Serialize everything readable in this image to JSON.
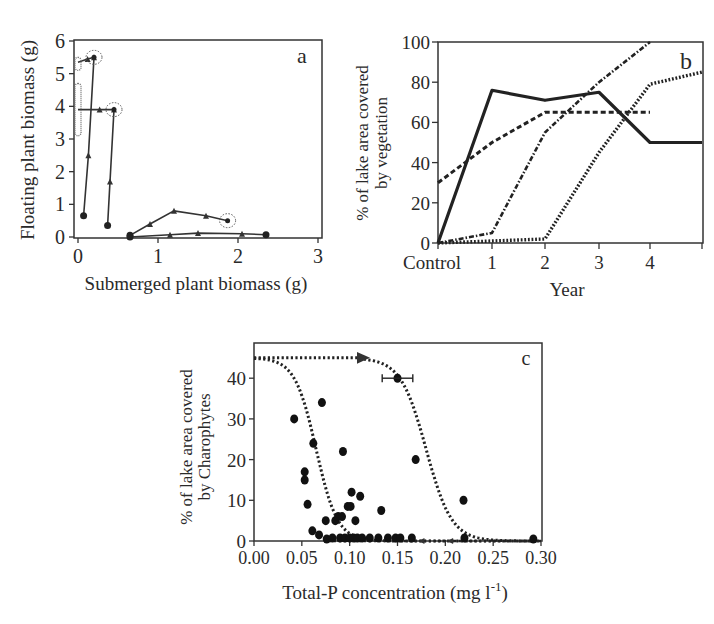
{
  "chart_data": [
    {
      "panel": "a",
      "type": "line",
      "title": "",
      "panel_label": "a",
      "xlabel": "Submerged plant biomass (g)",
      "ylabel": "Floating plant  biomass (g)",
      "xlim": [
        0,
        3
      ],
      "ylim": [
        0,
        6
      ],
      "xticks": [
        "0",
        "1",
        "2",
        "3"
      ],
      "yticks": [
        "0",
        "1",
        "2",
        "3",
        "4",
        "5",
        "6"
      ],
      "grid": false,
      "legend": null,
      "series": [
        {
          "name": "trajectory 1 (floating-dominated start)",
          "points": [
            [
              0.07,
              0.65
            ],
            [
              0.13,
              2.5
            ],
            [
              0.2,
              5.5
            ],
            [
              0.12,
              5.45
            ],
            [
              0.0,
              5.35
            ]
          ],
          "end_circled": [
            0.2,
            5.5
          ],
          "cluster_at_x0": [
            5.1,
            5.5
          ]
        },
        {
          "name": "trajectory 2",
          "points": [
            [
              0.37,
              0.35
            ],
            [
              0.4,
              1.7
            ],
            [
              0.45,
              3.9
            ],
            [
              0.27,
              3.9
            ],
            [
              0.0,
              3.9
            ]
          ],
          "end_circled": [
            0.45,
            3.9
          ],
          "cluster_at_x0": [
            3.1,
            4.7
          ]
        },
        {
          "name": "trajectory 3",
          "points": [
            [
              0.65,
              0.05
            ],
            [
              0.9,
              0.4
            ],
            [
              1.2,
              0.8
            ],
            [
              1.6,
              0.65
            ],
            [
              1.87,
              0.5
            ]
          ],
          "end_circled": [
            1.87,
            0.5
          ]
        },
        {
          "name": "trajectory 4",
          "points": [
            [
              0.65,
              0.0
            ],
            [
              1.15,
              0.07
            ],
            [
              1.5,
              0.12
            ],
            [
              2.05,
              0.1
            ],
            [
              2.35,
              0.07
            ]
          ]
        }
      ]
    },
    {
      "panel": "b",
      "type": "line",
      "title": "",
      "panel_label": "b",
      "xlabel": "Year",
      "ylabel": "% of lake area covered by vegetation",
      "ylabel_lines": [
        "% of lake area covered",
        "by vegetation"
      ],
      "categories": [
        "Control",
        "1",
        "2",
        "3",
        "4",
        "5"
      ],
      "xticks": [
        "Control",
        "1",
        "2",
        "3",
        "4"
      ],
      "yticks": [
        "0",
        "20",
        "40",
        "60",
        "80",
        "100"
      ],
      "ylim": [
        0,
        100
      ],
      "grid": false,
      "legend": null,
      "series": [
        {
          "name": "solid",
          "style": "solid",
          "values": [
            0,
            76,
            71,
            75,
            50,
            50
          ]
        },
        {
          "name": "dashed",
          "style": "dashed",
          "values": [
            30,
            50,
            65,
            65,
            65,
            null
          ]
        },
        {
          "name": "dash-dot",
          "style": "dashdot",
          "values": [
            0,
            5,
            55,
            80,
            100,
            null
          ]
        },
        {
          "name": "dotted",
          "style": "dotted",
          "values": [
            0,
            1,
            2,
            45,
            79,
            85
          ]
        }
      ]
    },
    {
      "panel": "c",
      "type": "scatter",
      "title": "",
      "panel_label": "c",
      "xlabel": "Total-P concentration (mg l-1)",
      "xlabel_main": "Total-P concentration (mg l",
      "xlabel_sup": "-1",
      "xlabel_end": ")",
      "ylabel": "% of lake area covered by Charophytes",
      "ylabel_lines": [
        "% of lake area covered",
        "by Charophytes"
      ],
      "xlim": [
        0,
        0.3
      ],
      "ylim": [
        0,
        48
      ],
      "xticks": [
        "0.00",
        "0.05",
        "0.10",
        "0.15",
        "0.20",
        "0.25",
        "0.30"
      ],
      "yticks": [
        "0",
        "10",
        "20",
        "30",
        "40"
      ],
      "grid": false,
      "legend": null,
      "points": [
        [
          0.042,
          30
        ],
        [
          0.053,
          17
        ],
        [
          0.053,
          15
        ],
        [
          0.056,
          9
        ],
        [
          0.062,
          24
        ],
        [
          0.071,
          34
        ],
        [
          0.061,
          2.5
        ],
        [
          0.068,
          1.5
        ],
        [
          0.075,
          5
        ],
        [
          0.076,
          0.5
        ],
        [
          0.085,
          5
        ],
        [
          0.088,
          6
        ],
        [
          0.092,
          6
        ],
        [
          0.093,
          22
        ],
        [
          0.098,
          8.5
        ],
        [
          0.101,
          8.5
        ],
        [
          0.102,
          12
        ],
        [
          0.106,
          5
        ],
        [
          0.111,
          11
        ],
        [
          0.133,
          7.5
        ],
        [
          0.15,
          40
        ],
        [
          0.169,
          20
        ],
        [
          0.219,
          10
        ],
        [
          0.292,
          0.5
        ],
        [
          0.082,
          0
        ],
        [
          0.09,
          0
        ],
        [
          0.095,
          0
        ],
        [
          0.1,
          0
        ],
        [
          0.104,
          0
        ],
        [
          0.108,
          0
        ],
        [
          0.113,
          0
        ],
        [
          0.121,
          0
        ],
        [
          0.13,
          0
        ],
        [
          0.14,
          0
        ],
        [
          0.148,
          0
        ],
        [
          0.153,
          0
        ],
        [
          0.165,
          0
        ],
        [
          0.22,
          0
        ]
      ],
      "error_bar": {
        "x": 0.15,
        "y": 40,
        "xerr": 0.016
      },
      "curves": [
        {
          "name": "backward switch (decreasing P)",
          "style": "dotted",
          "threshold_x": 0.065,
          "upper": 45,
          "lower": 0,
          "arrow_at_x": 0.11,
          "arrow_y": 45
        },
        {
          "name": "forward switch (increasing P)",
          "style": "dotted",
          "threshold_x": 0.18,
          "upper": 45,
          "lower": 0
        }
      ]
    }
  ]
}
